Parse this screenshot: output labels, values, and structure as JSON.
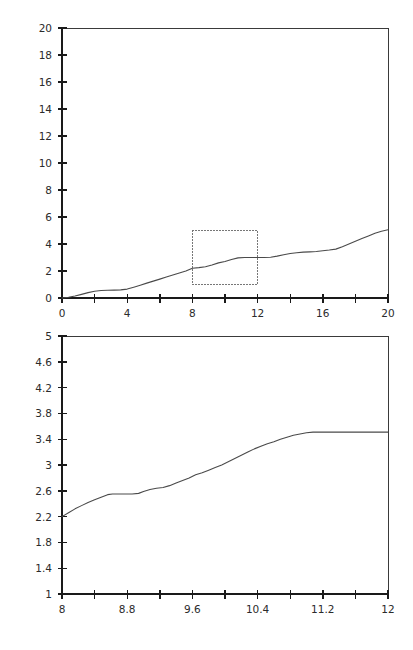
{
  "figure": {
    "background": "#ffffff",
    "line_color": "#4a4a4a",
    "axis_color": "#1a1a1a",
    "inset_box_color": "#777777"
  },
  "chart_data": [
    {
      "type": "line",
      "title": "",
      "subtitle": "",
      "xlabel": "",
      "ylabel": "",
      "xlim": [
        0,
        20
      ],
      "ylim": [
        0,
        20
      ],
      "grid": false,
      "legend": null,
      "xticks": [
        0,
        2,
        4,
        6,
        8,
        10,
        12,
        14,
        16,
        18,
        20
      ],
      "xtick_labels": [
        "0",
        "",
        "4",
        "",
        "8",
        "",
        "12",
        "",
        "16",
        "",
        "20"
      ],
      "yticks": [
        0,
        2,
        4,
        6,
        8,
        10,
        12,
        14,
        16,
        18,
        20
      ],
      "ytick_labels": [
        "0",
        "2",
        "4",
        "6",
        "8",
        "10",
        "12",
        "14",
        "16",
        "18",
        "20"
      ],
      "annotations": [
        {
          "kind": "inset-region-box",
          "style": "dotted",
          "x0": 8,
          "x1": 12,
          "y0": 1,
          "y1": 5
        }
      ],
      "series": [
        {
          "name": "curve",
          "x": [
            0.0,
            0.4,
            0.8,
            1.2,
            1.6,
            2.0,
            2.4,
            2.8,
            3.2,
            3.6,
            4.0,
            4.4,
            4.8,
            5.2,
            5.6,
            6.0,
            6.4,
            6.8,
            7.2,
            7.6,
            8.0,
            8.4,
            8.8,
            9.2,
            9.6,
            10.0,
            10.4,
            10.8,
            11.2,
            11.6,
            12.0,
            12.4,
            12.8,
            13.2,
            13.6,
            14.0,
            14.4,
            14.8,
            15.2,
            15.6,
            16.0,
            16.4,
            16.8,
            17.2,
            17.6,
            18.0,
            18.4,
            18.8,
            19.2,
            19.6,
            20.0
          ],
          "y": [
            0.0,
            0.06,
            0.15,
            0.27,
            0.4,
            0.5,
            0.55,
            0.57,
            0.58,
            0.6,
            0.66,
            0.8,
            0.95,
            1.1,
            1.25,
            1.4,
            1.55,
            1.7,
            1.85,
            2.0,
            2.2,
            2.25,
            2.32,
            2.45,
            2.6,
            2.7,
            2.85,
            2.97,
            3.0,
            3.0,
            3.0,
            3.0,
            3.02,
            3.1,
            3.2,
            3.3,
            3.35,
            3.4,
            3.42,
            3.45,
            3.5,
            3.55,
            3.62,
            3.8,
            4.0,
            4.2,
            4.4,
            4.6,
            4.8,
            4.95,
            5.05
          ]
        }
      ]
    },
    {
      "type": "line",
      "title": "",
      "subtitle": "",
      "xlabel": "",
      "ylabel": "",
      "xlim": [
        8,
        12
      ],
      "ylim": [
        1,
        5
      ],
      "grid": false,
      "legend": null,
      "xticks": [
        8,
        8.4,
        8.8,
        9.2,
        9.6,
        10.0,
        10.4,
        10.8,
        11.2,
        11.6,
        12.0
      ],
      "xtick_labels": [
        "8",
        "",
        "8.8",
        "",
        "9.6",
        "",
        "10.4",
        "",
        "11.2",
        "",
        "12"
      ],
      "yticks": [
        1,
        1.4,
        1.8,
        2.2,
        2.6,
        3.0,
        3.4,
        3.8,
        4.2,
        4.6,
        5.0
      ],
      "ytick_labels": [
        "1",
        "1.4",
        "1.8",
        "2.2",
        "2.6",
        "3",
        "3.4",
        "3.8",
        "4.2",
        "4.6",
        "5"
      ],
      "annotations": [],
      "series": [
        {
          "name": "curve-zoom",
          "x": [
            8.0,
            8.08,
            8.16,
            8.24,
            8.32,
            8.4,
            8.48,
            8.56,
            8.62,
            8.7,
            8.78,
            8.86,
            8.94,
            9.0,
            9.08,
            9.16,
            9.24,
            9.32,
            9.4,
            9.48,
            9.56,
            9.64,
            9.72,
            9.8,
            9.88,
            9.96,
            10.04,
            10.12,
            10.2,
            10.28,
            10.36,
            10.44,
            10.52,
            10.6,
            10.68,
            10.76,
            10.84,
            10.92,
            11.0,
            11.08,
            11.16,
            11.24,
            11.4,
            11.6,
            11.8,
            12.0
          ],
          "y": [
            2.2,
            2.26,
            2.32,
            2.37,
            2.42,
            2.46,
            2.5,
            2.54,
            2.55,
            2.55,
            2.55,
            2.55,
            2.56,
            2.59,
            2.62,
            2.64,
            2.65,
            2.68,
            2.72,
            2.76,
            2.8,
            2.85,
            2.88,
            2.92,
            2.96,
            3.0,
            3.05,
            3.1,
            3.15,
            3.2,
            3.25,
            3.29,
            3.33,
            3.36,
            3.4,
            3.43,
            3.46,
            3.48,
            3.5,
            3.51,
            3.51,
            3.51,
            3.51,
            3.51,
            3.51,
            3.51
          ]
        }
      ]
    }
  ]
}
